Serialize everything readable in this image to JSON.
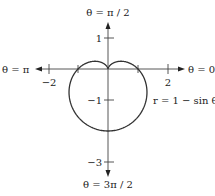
{
  "diagram": {
    "type": "polar-graph",
    "equation": "r = 1 − sin θ",
    "axis_labels": {
      "top": "θ = π / 2",
      "right": "θ = 0",
      "left": "θ = π",
      "bottom": "θ = 3π / 2"
    },
    "ticks": {
      "x": [
        {
          "value": -2,
          "label": "−2"
        },
        {
          "value": 2,
          "label": "2"
        }
      ],
      "y": [
        {
          "value": 1,
          "label": "1"
        },
        {
          "value": -1,
          "label": "−1"
        },
        {
          "value": -3,
          "label": "−3"
        }
      ]
    },
    "curve": {
      "name": "cardioid",
      "color": "#333333"
    }
  }
}
